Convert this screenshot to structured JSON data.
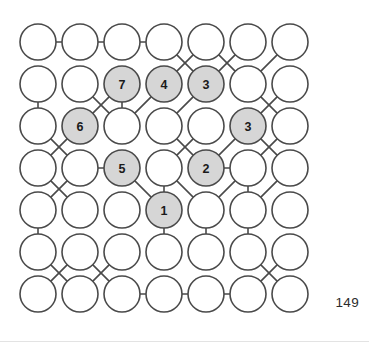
{
  "figure": {
    "caption_number": "149",
    "geometry": {
      "origin_x": 38,
      "origin_y": 42,
      "step_x": 42,
      "step_y": 42,
      "radius": 18,
      "rows": 7,
      "cols": 7
    },
    "colors": {
      "stroke": "#4a4a4a",
      "node_fill": "#ffffff",
      "node_fill_shaded": "#d6d6d6",
      "label_color": "#1a1a1a",
      "page_number_color": "#2b2b2b",
      "background": "#ffffff"
    },
    "nodes": [
      {
        "id": "r1c1",
        "row": 1,
        "col": 1,
        "label": "",
        "shaded": false
      },
      {
        "id": "r1c2",
        "row": 1,
        "col": 2,
        "label": "",
        "shaded": false
      },
      {
        "id": "r1c3",
        "row": 1,
        "col": 3,
        "label": "",
        "shaded": false
      },
      {
        "id": "r1c4",
        "row": 1,
        "col": 4,
        "label": "",
        "shaded": false
      },
      {
        "id": "r1c5",
        "row": 1,
        "col": 5,
        "label": "",
        "shaded": false
      },
      {
        "id": "r1c6",
        "row": 1,
        "col": 6,
        "label": "",
        "shaded": false
      },
      {
        "id": "r1c7",
        "row": 1,
        "col": 7,
        "label": "",
        "shaded": false
      },
      {
        "id": "r2c1",
        "row": 2,
        "col": 1,
        "label": "",
        "shaded": false
      },
      {
        "id": "r2c2",
        "row": 2,
        "col": 2,
        "label": "",
        "shaded": false
      },
      {
        "id": "r2c3",
        "row": 2,
        "col": 3,
        "label": "7",
        "shaded": true
      },
      {
        "id": "r2c4",
        "row": 2,
        "col": 4,
        "label": "4",
        "shaded": true
      },
      {
        "id": "r2c5",
        "row": 2,
        "col": 5,
        "label": "3",
        "shaded": true
      },
      {
        "id": "r2c6",
        "row": 2,
        "col": 6,
        "label": "",
        "shaded": false
      },
      {
        "id": "r2c7",
        "row": 2,
        "col": 7,
        "label": "",
        "shaded": false
      },
      {
        "id": "r3c1",
        "row": 3,
        "col": 1,
        "label": "",
        "shaded": false
      },
      {
        "id": "r3c2",
        "row": 3,
        "col": 2,
        "label": "6",
        "shaded": true
      },
      {
        "id": "r3c3",
        "row": 3,
        "col": 3,
        "label": "",
        "shaded": false
      },
      {
        "id": "r3c4",
        "row": 3,
        "col": 4,
        "label": "",
        "shaded": false
      },
      {
        "id": "r3c5",
        "row": 3,
        "col": 5,
        "label": "",
        "shaded": false
      },
      {
        "id": "r3c6",
        "row": 3,
        "col": 6,
        "label": "3",
        "shaded": true
      },
      {
        "id": "r3c7",
        "row": 3,
        "col": 7,
        "label": "",
        "shaded": false
      },
      {
        "id": "r4c1",
        "row": 4,
        "col": 1,
        "label": "",
        "shaded": false
      },
      {
        "id": "r4c2",
        "row": 4,
        "col": 2,
        "label": "",
        "shaded": false
      },
      {
        "id": "r4c3",
        "row": 4,
        "col": 3,
        "label": "5",
        "shaded": true
      },
      {
        "id": "r4c4",
        "row": 4,
        "col": 4,
        "label": "",
        "shaded": false
      },
      {
        "id": "r4c5",
        "row": 4,
        "col": 5,
        "label": "2",
        "shaded": true
      },
      {
        "id": "r4c6",
        "row": 4,
        "col": 6,
        "label": "",
        "shaded": false
      },
      {
        "id": "r4c7",
        "row": 4,
        "col": 7,
        "label": "",
        "shaded": false
      },
      {
        "id": "r5c1",
        "row": 5,
        "col": 1,
        "label": "",
        "shaded": false
      },
      {
        "id": "r5c2",
        "row": 5,
        "col": 2,
        "label": "",
        "shaded": false
      },
      {
        "id": "r5c3",
        "row": 5,
        "col": 3,
        "label": "",
        "shaded": false
      },
      {
        "id": "r5c4",
        "row": 5,
        "col": 4,
        "label": "1",
        "shaded": true
      },
      {
        "id": "r5c5",
        "row": 5,
        "col": 5,
        "label": "",
        "shaded": false
      },
      {
        "id": "r5c6",
        "row": 5,
        "col": 6,
        "label": "",
        "shaded": false
      },
      {
        "id": "r5c7",
        "row": 5,
        "col": 7,
        "label": "",
        "shaded": false
      },
      {
        "id": "r6c1",
        "row": 6,
        "col": 1,
        "label": "",
        "shaded": false
      },
      {
        "id": "r6c2",
        "row": 6,
        "col": 2,
        "label": "",
        "shaded": false
      },
      {
        "id": "r6c3",
        "row": 6,
        "col": 3,
        "label": "",
        "shaded": false
      },
      {
        "id": "r6c4",
        "row": 6,
        "col": 4,
        "label": "",
        "shaded": false
      },
      {
        "id": "r6c5",
        "row": 6,
        "col": 5,
        "label": "",
        "shaded": false
      },
      {
        "id": "r6c6",
        "row": 6,
        "col": 6,
        "label": "",
        "shaded": false
      },
      {
        "id": "r6c7",
        "row": 6,
        "col": 7,
        "label": "",
        "shaded": false
      },
      {
        "id": "r7c1",
        "row": 7,
        "col": 1,
        "label": "",
        "shaded": false
      },
      {
        "id": "r7c2",
        "row": 7,
        "col": 2,
        "label": "",
        "shaded": false
      },
      {
        "id": "r7c3",
        "row": 7,
        "col": 3,
        "label": "",
        "shaded": false
      },
      {
        "id": "r7c4",
        "row": 7,
        "col": 4,
        "label": "",
        "shaded": false
      },
      {
        "id": "r7c5",
        "row": 7,
        "col": 5,
        "label": "",
        "shaded": false
      },
      {
        "id": "r7c6",
        "row": 7,
        "col": 6,
        "label": "",
        "shaded": false
      },
      {
        "id": "r7c7",
        "row": 7,
        "col": 7,
        "label": "",
        "shaded": false
      }
    ],
    "edges": [
      [
        "r1c1",
        "r1c2"
      ],
      [
        "r1c2",
        "r1c3"
      ],
      [
        "r1c3",
        "r1c4"
      ],
      [
        "r1c4",
        "r2c5"
      ],
      [
        "r1c5",
        "r2c4"
      ],
      [
        "r1c5",
        "r2c6"
      ],
      [
        "r1c6",
        "r2c5"
      ],
      [
        "r1c7",
        "r2c6"
      ],
      [
        "r2c1",
        "r3c1"
      ],
      [
        "r2c2",
        "r3c3"
      ],
      [
        "r2c3",
        "r3c2"
      ],
      [
        "r2c3",
        "r3c3"
      ],
      [
        "r2c4",
        "r3c3"
      ],
      [
        "r2c5",
        "r3c4"
      ],
      [
        "r2c6",
        "r3c7"
      ],
      [
        "r2c7",
        "r3c6"
      ],
      [
        "r3c1",
        "r4c2"
      ],
      [
        "r3c2",
        "r4c1"
      ],
      [
        "r3c4",
        "r4c5"
      ],
      [
        "r3c5",
        "r4c4"
      ],
      [
        "r3c6",
        "r4c5"
      ],
      [
        "r3c6",
        "r4c7"
      ],
      [
        "r3c7",
        "r4c6"
      ],
      [
        "r4c1",
        "r5c2"
      ],
      [
        "r4c2",
        "r5c1"
      ],
      [
        "r4c2",
        "r4c3"
      ],
      [
        "r4c3",
        "r5c4"
      ],
      [
        "r4c4",
        "r5c4"
      ],
      [
        "r4c4",
        "r5c5"
      ],
      [
        "r4c5",
        "r4c6"
      ],
      [
        "r4c6",
        "r5c5"
      ],
      [
        "r4c6",
        "r5c6"
      ],
      [
        "r4c7",
        "r5c6"
      ],
      [
        "r5c1",
        "r6c1"
      ],
      [
        "r5c4",
        "r6c4"
      ],
      [
        "r5c5",
        "r6c5"
      ],
      [
        "r5c6",
        "r6c6"
      ],
      [
        "r6c1",
        "r7c2"
      ],
      [
        "r6c2",
        "r7c1"
      ],
      [
        "r6c2",
        "r7c3"
      ],
      [
        "r6c3",
        "r7c2"
      ],
      [
        "r6c6",
        "r7c7"
      ],
      [
        "r6c7",
        "r7c6"
      ],
      [
        "r7c3",
        "r7c4"
      ],
      [
        "r7c4",
        "r7c5"
      ],
      [
        "r7c5",
        "r7c6"
      ]
    ]
  }
}
